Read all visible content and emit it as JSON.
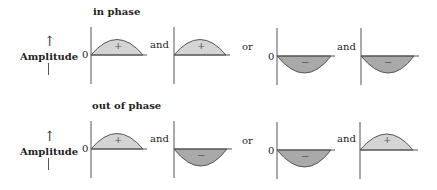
{
  "colors": {
    "positive_fill": "#d4d4d4",
    "negative_fill": "#a9a9a9",
    "stroke": "#555555",
    "text": "#222222"
  },
  "axis_label": "Amplitude",
  "zero_label": "0",
  "rows": [
    {
      "title": "in phase",
      "panels": [
        {
          "sign": "+",
          "lobe": "positive",
          "zero_shown": true
        },
        {
          "connector": "and",
          "sign": "+",
          "lobe": "positive",
          "zero_shown": false
        },
        {
          "connector": "or",
          "sign": "−",
          "lobe": "negative",
          "zero_shown": true
        },
        {
          "connector": "and",
          "sign": "−",
          "lobe": "negative",
          "zero_shown": false
        }
      ]
    },
    {
      "title": "out of phase",
      "panels": [
        {
          "sign": "+",
          "lobe": "positive",
          "zero_shown": true
        },
        {
          "connector": "and",
          "sign": "−",
          "lobe": "negative",
          "zero_shown": false
        },
        {
          "connector": "or",
          "sign": "−",
          "lobe": "negative",
          "zero_shown": true
        },
        {
          "connector": "and",
          "sign": "+",
          "lobe": "positive",
          "zero_shown": false
        }
      ]
    }
  ]
}
